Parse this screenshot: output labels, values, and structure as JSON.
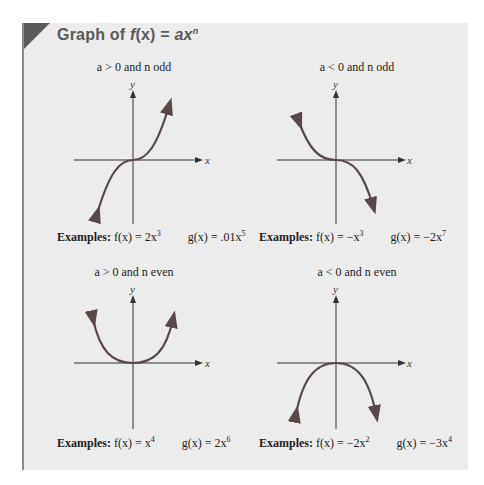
{
  "title": {
    "prefix": "Graph of ",
    "f": "f",
    "x": "(x)",
    "eq": " = ",
    "ax": "ax",
    "n": "n"
  },
  "colors": {
    "panel_bg": "#ececec",
    "corner": "#5a5a5a",
    "title": "#5a5a5a",
    "curve": "#5a4848",
    "axis": "#333333"
  },
  "quadrants": [
    {
      "condition": "a > 0 and n odd",
      "examples_label": "Examples:",
      "f_expr": "f(x) = 2x",
      "f_exp": "3",
      "g_expr": "g(x) = .01x",
      "g_exp": "5",
      "axis_x": "x",
      "axis_y": "y"
    },
    {
      "condition": "a < 0 and n odd",
      "examples_label": "Examples:",
      "f_expr": "f(x) = −x",
      "f_exp": "3",
      "g_expr": "g(x) = −2x",
      "g_exp": "7",
      "axis_x": "x",
      "axis_y": "y"
    },
    {
      "condition": "a > 0 and n even",
      "examples_label": "Examples:",
      "f_expr": "f(x) = x",
      "f_exp": "4",
      "g_expr": "g(x) = 2x",
      "g_exp": "6",
      "axis_x": "x",
      "axis_y": "y"
    },
    {
      "condition": "a < 0 and n even",
      "examples_label": "Examples:",
      "f_expr": "f(x) = −2x",
      "f_exp": "2",
      "g_expr": "g(x) = −3x",
      "g_exp": "4",
      "axis_x": "x",
      "axis_y": "y"
    }
  ]
}
